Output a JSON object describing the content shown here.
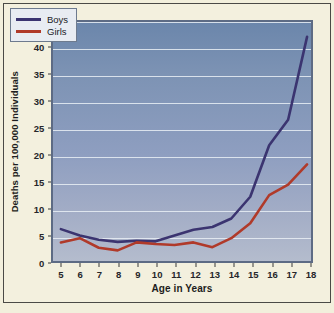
{
  "chart_data": {
    "type": "line",
    "title": "",
    "xlabel": "Age in Years",
    "ylabel": "Deaths per 100,000 Individuals",
    "x": [
      5,
      6,
      7,
      8,
      9,
      10,
      11,
      12,
      13,
      14,
      15,
      16,
      17,
      18
    ],
    "xtick_labels": [
      "5",
      "6",
      "7",
      "8",
      "9",
      "10",
      "11",
      "12",
      "13",
      "14",
      "15",
      "16",
      "17",
      "18"
    ],
    "ytick_labels": [
      "0",
      "5",
      "10",
      "15",
      "20",
      "25",
      "30",
      "35",
      "40",
      "45"
    ],
    "yticks": [
      0,
      5,
      10,
      15,
      20,
      25,
      30,
      35,
      40,
      45
    ],
    "ylim": [
      0,
      45
    ],
    "xlim": [
      5,
      18
    ],
    "grid": "horizontal",
    "legend_position": "top-left",
    "series": [
      {
        "name": "Boys",
        "color": "#3b3470",
        "values": [
          6.0,
          4.8,
          4.0,
          3.6,
          3.8,
          3.7,
          4.8,
          5.9,
          6.4,
          8.0,
          12.1,
          21.8,
          26.6,
          42.2
        ]
      },
      {
        "name": "Girls",
        "color": "#b03a2a",
        "values": [
          3.5,
          4.3,
          2.5,
          2.0,
          3.5,
          3.2,
          3.0,
          3.5,
          2.6,
          4.3,
          7.1,
          12.4,
          14.4,
          18.2
        ]
      }
    ]
  },
  "legend": {
    "entries": [
      {
        "label": "Boys"
      },
      {
        "label": "Girls"
      }
    ]
  },
  "colors": {
    "boys": "#3b3470",
    "girls": "#b03a2a",
    "grid": "#e9eef4",
    "plot_bg_top": "#6b86ab",
    "plot_bg_bottom": "#b4bccd",
    "page_bg": "#f2efdc",
    "frame_border": "#4a4a46"
  }
}
